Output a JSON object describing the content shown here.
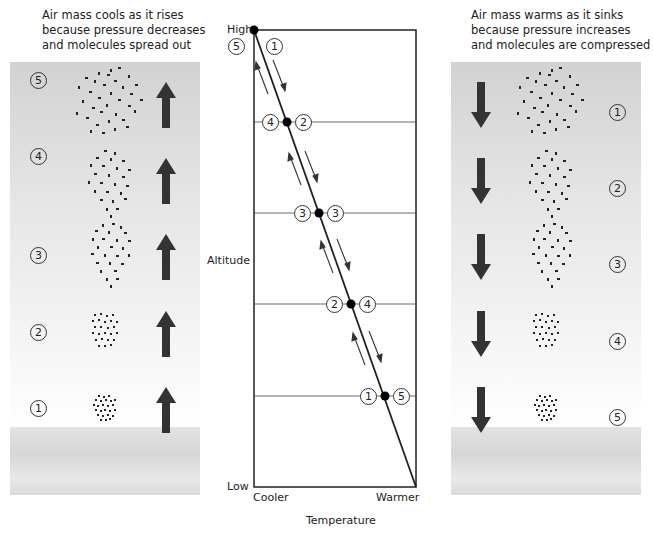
{
  "left_panel": {
    "caption": [
      "Air mass cools as it rises",
      "because pressure decreases",
      "and molecules spread out"
    ],
    "direction": "up",
    "levels": [
      {
        "number": "5",
        "label": "⑤"
      },
      {
        "number": "4",
        "label": "④"
      },
      {
        "number": "3",
        "label": "③"
      },
      {
        "number": "2",
        "label": "②"
      },
      {
        "number": "1",
        "label": "①"
      }
    ]
  },
  "right_panel": {
    "caption": [
      "Air mass warms as it sinks",
      "because pressure increases",
      "and molecules are compressed"
    ],
    "direction": "down",
    "levels": [
      {
        "number": "1",
        "label": "①"
      },
      {
        "number": "2",
        "label": "②"
      },
      {
        "number": "3",
        "label": "③"
      },
      {
        "number": "4",
        "label": "④"
      },
      {
        "number": "5",
        "label": "⑤"
      }
    ]
  },
  "chart": {
    "y_axis_label": "Altitude",
    "y_high": "High",
    "y_low": "Low",
    "x_axis_label": "Temperature",
    "x_cool": "Cooler",
    "x_warm": "Warmer",
    "top_left_number": "5",
    "top_right_number": "1",
    "points": [
      {
        "left": "4",
        "right": "2"
      },
      {
        "left": "3",
        "right": "3"
      },
      {
        "left": "2",
        "right": "4"
      },
      {
        "left": "1",
        "right": "5"
      }
    ]
  },
  "colors": {
    "arrow": "#333333",
    "panel_top": "#d2d2d2",
    "line": "#222222"
  }
}
